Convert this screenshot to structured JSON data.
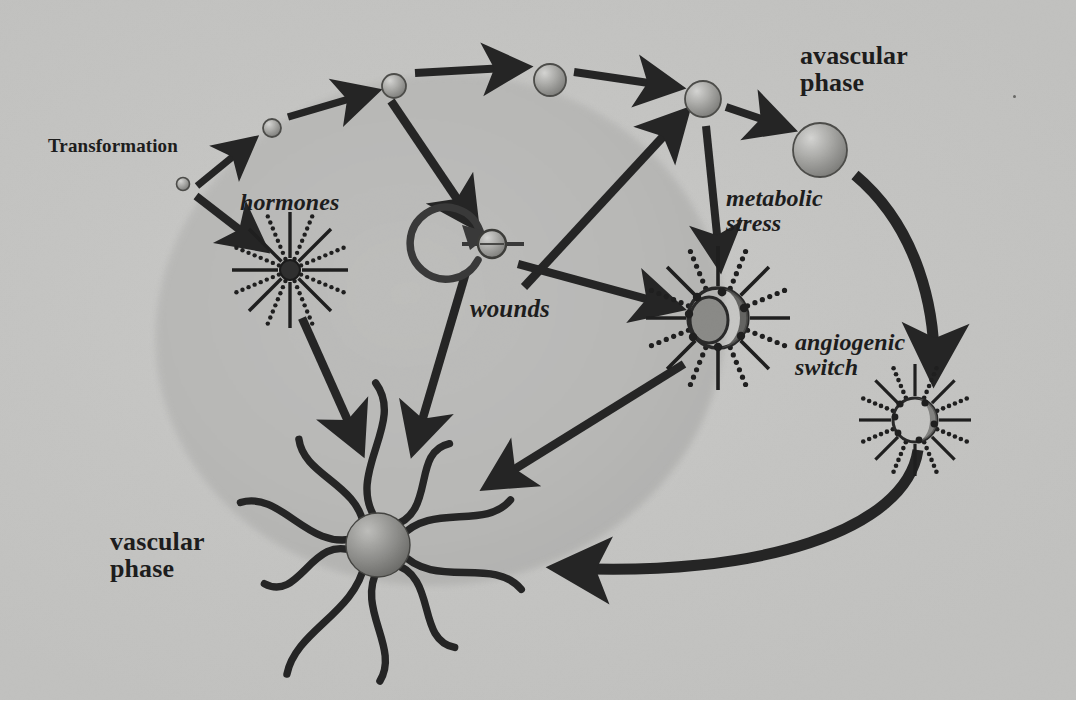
{
  "figure": {
    "kind": "biological-process-diagram",
    "canvas": {
      "width": 1084,
      "height": 722
    },
    "page_background": "#ffffff",
    "scan_background": "#c9c9c7",
    "ink_color": "#232323",
    "halo_color": "#b9b9b7"
  },
  "labels": {
    "transformation": {
      "text": "Transformation",
      "style": "bold",
      "x": 48,
      "y": 136,
      "size": 19
    },
    "hormones": {
      "text": "hormones",
      "style": "italic",
      "x": 240,
      "y": 190,
      "size": 24
    },
    "wounds": {
      "text": "wounds",
      "style": "italic",
      "x": 470,
      "y": 296,
      "size": 25
    },
    "metabolic_stress": {
      "text": "metabolic\nstress",
      "style": "italic",
      "x": 726,
      "y": 186,
      "size": 24
    },
    "avascular_phase": {
      "text": "avascular\nphase",
      "style": "bold",
      "x": 800,
      "y": 42,
      "size": 26
    },
    "angiogenic_switch": {
      "text": "angiogenic\nswitch",
      "style": "italic",
      "x": 795,
      "y": 330,
      "size": 24
    },
    "vascular_phase": {
      "text": "vascular\nphase",
      "style": "bold",
      "x": 110,
      "y": 528,
      "size": 26
    }
  },
  "shapes": {
    "tissue_ellipse": {
      "cx": 440,
      "cy": 330,
      "rx": 285,
      "ry": 255,
      "rotate": -8,
      "fill": "#bfbfbd"
    },
    "progression_cells": [
      {
        "name": "cell-transformed-1",
        "cx": 183,
        "cy": 184,
        "r": 6.5
      },
      {
        "name": "cell-transformed-2",
        "cx": 272,
        "cy": 128,
        "r": 9
      },
      {
        "name": "cell-transformed-3",
        "cx": 394,
        "cy": 86,
        "r": 12
      },
      {
        "name": "cell-transformed-4",
        "cx": 550,
        "cy": 80,
        "r": 16
      },
      {
        "name": "cell-transformed-5",
        "cx": 703,
        "cy": 99,
        "r": 18
      },
      {
        "name": "cell-avascular",
        "cx": 820,
        "cy": 150,
        "r": 27
      }
    ],
    "wound_cell": {
      "cx": 492,
      "cy": 244,
      "r": 14
    },
    "hormone_cell": {
      "cx": 290,
      "cy": 270,
      "r": 10,
      "rays": 16,
      "ray_len": 48
    },
    "stress_cell": {
      "cx": 718,
      "cy": 318,
      "r": 30,
      "rays": 16,
      "ray_len": 42
    },
    "switch_cell": {
      "cx": 915,
      "cy": 420,
      "r": 22,
      "rays": 16,
      "ray_len": 34
    },
    "vascular_tumor": {
      "cx": 378,
      "cy": 545,
      "r": 32,
      "vessels": 10
    }
  },
  "arrows": [
    {
      "name": "arrow-transformation-to-cell2",
      "from": "transformation-label",
      "to": "cell-transformed-2"
    },
    {
      "name": "arrow-cell2-to-cell3",
      "from": "cell-transformed-2",
      "to": "cell-transformed-3"
    },
    {
      "name": "arrow-cell3-to-cell4",
      "from": "cell-transformed-3",
      "to": "cell-transformed-4"
    },
    {
      "name": "arrow-cell4-to-cell5",
      "from": "cell-transformed-4",
      "to": "cell-transformed-5"
    },
    {
      "name": "arrow-cell5-to-avascular",
      "from": "cell-transformed-5",
      "to": "cell-avascular"
    },
    {
      "name": "arrow-cell1-to-hormones",
      "from": "cell-transformed-1",
      "to": "hormone-cell"
    },
    {
      "name": "arrow-cell3-to-wounds",
      "from": "cell-transformed-3",
      "to": "wound-cell"
    },
    {
      "name": "arrow-wounds-self-loop",
      "from": "wound-cell",
      "to": "wound-cell"
    },
    {
      "name": "arrow-wounds-to-cell5",
      "from": "wound-cell",
      "to": "cell-transformed-5"
    },
    {
      "name": "arrow-wounds-to-stress",
      "from": "wound-cell",
      "to": "stress-cell"
    },
    {
      "name": "arrow-cell5-to-stress",
      "from": "cell-transformed-5",
      "to": "stress-cell"
    },
    {
      "name": "arrow-hormones-to-vascular",
      "from": "hormone-cell",
      "to": "vascular-tumor"
    },
    {
      "name": "arrow-wounds-to-vascular",
      "from": "wound-cell",
      "to": "vascular-tumor"
    },
    {
      "name": "arrow-stress-to-vascular",
      "from": "stress-cell",
      "to": "vascular-tumor"
    },
    {
      "name": "arrow-avascular-to-switch",
      "from": "cell-avascular",
      "to": "switch-cell"
    },
    {
      "name": "arrow-switch-to-vascular",
      "from": "switch-cell",
      "to": "vascular-tumor"
    }
  ],
  "artifacts": [
    {
      "name": "scan-speck",
      "x": 1013,
      "y": 95
    }
  ]
}
